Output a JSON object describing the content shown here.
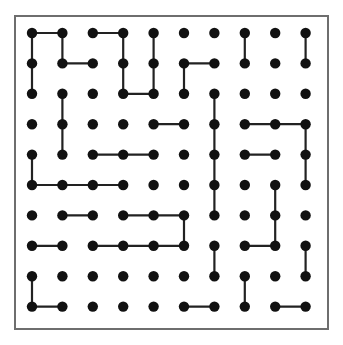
{
  "canvas": {
    "width": 343,
    "height": 345,
    "background_color": "#ffffff"
  },
  "frame": {
    "label": "puzzle-border",
    "x": 14,
    "y": 15,
    "width": 315,
    "height": 315,
    "border_color": "#6e6e6e",
    "border_width": 2,
    "fill_color": "#ffffff"
  },
  "grid": {
    "rows": 10,
    "columns": 10,
    "origin_x": 32,
    "origin_y": 33,
    "spacing_x": 30.4,
    "spacing_y": 30.4,
    "dot_radius": 5.2,
    "dot_color": "#111111",
    "edge_color": "#222222",
    "edge_width": 2.2
  },
  "chart_data": {
    "type": "scatter",
    "xlabel": "",
    "ylabel": "",
    "grid": true,
    "legend": "none",
    "rows": 10,
    "columns": 10,
    "dot_count": 100,
    "x": [
      1,
      2,
      3,
      4,
      5,
      6,
      7,
      8,
      9,
      10
    ],
    "y": [
      1,
      2,
      3,
      4,
      5,
      6,
      7,
      8,
      9,
      10
    ],
    "edges_horizontal": [
      {
        "row": 1,
        "col_from": 1,
        "col_to": 2
      },
      {
        "row": 1,
        "col_from": 3,
        "col_to": 4
      },
      {
        "row": 2,
        "col_from": 2,
        "col_to": 3
      },
      {
        "row": 2,
        "col_from": 6,
        "col_to": 7
      },
      {
        "row": 3,
        "col_from": 4,
        "col_to": 5
      },
      {
        "row": 4,
        "col_from": 5,
        "col_to": 6
      },
      {
        "row": 4,
        "col_from": 8,
        "col_to": 9
      },
      {
        "row": 4,
        "col_from": 9,
        "col_to": 10
      },
      {
        "row": 5,
        "col_from": 3,
        "col_to": 4
      },
      {
        "row": 5,
        "col_from": 4,
        "col_to": 5
      },
      {
        "row": 5,
        "col_from": 8,
        "col_to": 9
      },
      {
        "row": 6,
        "col_from": 1,
        "col_to": 2
      },
      {
        "row": 6,
        "col_from": 2,
        "col_to": 3
      },
      {
        "row": 6,
        "col_from": 3,
        "col_to": 4
      },
      {
        "row": 7,
        "col_from": 2,
        "col_to": 3
      },
      {
        "row": 7,
        "col_from": 4,
        "col_to": 5
      },
      {
        "row": 7,
        "col_from": 5,
        "col_to": 6
      },
      {
        "row": 8,
        "col_from": 1,
        "col_to": 2
      },
      {
        "row": 8,
        "col_from": 3,
        "col_to": 4
      },
      {
        "row": 8,
        "col_from": 4,
        "col_to": 5
      },
      {
        "row": 8,
        "col_from": 5,
        "col_to": 6
      },
      {
        "row": 8,
        "col_from": 8,
        "col_to": 9
      },
      {
        "row": 10,
        "col_from": 1,
        "col_to": 2
      },
      {
        "row": 10,
        "col_from": 6,
        "col_to": 7
      },
      {
        "row": 10,
        "col_from": 9,
        "col_to": 10
      }
    ],
    "edges_vertical": [
      {
        "col": 1,
        "row_from": 1,
        "row_to": 2
      },
      {
        "col": 1,
        "row_from": 2,
        "row_to": 3
      },
      {
        "col": 1,
        "row_from": 5,
        "row_to": 6
      },
      {
        "col": 1,
        "row_from": 9,
        "row_to": 10
      },
      {
        "col": 2,
        "row_from": 1,
        "row_to": 2
      },
      {
        "col": 2,
        "row_from": 3,
        "row_to": 4
      },
      {
        "col": 2,
        "row_from": 4,
        "row_to": 5
      },
      {
        "col": 4,
        "row_from": 1,
        "row_to": 2
      },
      {
        "col": 4,
        "row_from": 2,
        "row_to": 3
      },
      {
        "col": 5,
        "row_from": 1,
        "row_to": 2
      },
      {
        "col": 5,
        "row_from": 2,
        "row_to": 3
      },
      {
        "col": 6,
        "row_from": 2,
        "row_to": 3
      },
      {
        "col": 6,
        "row_from": 7,
        "row_to": 8
      },
      {
        "col": 7,
        "row_from": 3,
        "row_to": 4
      },
      {
        "col": 7,
        "row_from": 4,
        "row_to": 5
      },
      {
        "col": 7,
        "row_from": 5,
        "row_to": 6
      },
      {
        "col": 7,
        "row_from": 6,
        "row_to": 7
      },
      {
        "col": 7,
        "row_from": 8,
        "row_to": 9
      },
      {
        "col": 8,
        "row_from": 1,
        "row_to": 2
      },
      {
        "col": 8,
        "row_from": 9,
        "row_to": 10
      },
      {
        "col": 9,
        "row_from": 6,
        "row_to": 7
      },
      {
        "col": 9,
        "row_from": 7,
        "row_to": 8
      },
      {
        "col": 10,
        "row_from": 1,
        "row_to": 2
      },
      {
        "col": 10,
        "row_from": 4,
        "row_to": 5
      },
      {
        "col": 10,
        "row_from": 5,
        "row_to": 6
      },
      {
        "col": 10,
        "row_from": 8,
        "row_to": 9
      }
    ]
  }
}
